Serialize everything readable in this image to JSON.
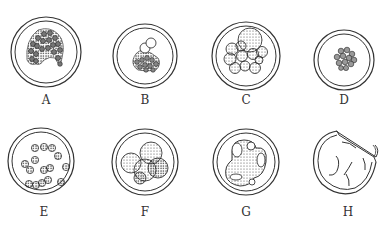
{
  "figure": {
    "panels": [
      {
        "label": "A",
        "cx": 46,
        "cy": 52,
        "r": 35,
        "content": "dense cluster of many small cells"
      },
      {
        "label": "B",
        "cx": 145,
        "cy": 56,
        "r": 32,
        "content": "compact cell mass with two larger cells on top"
      },
      {
        "label": "C",
        "cx": 246,
        "cy": 56,
        "r": 34,
        "content": "cluster of stippled cells with one large cell"
      },
      {
        "label": "D",
        "cx": 344,
        "cy": 60,
        "r": 30,
        "content": "small compact cluster of cells"
      },
      {
        "label": "E",
        "cx": 41,
        "cy": 161,
        "r": 33,
        "content": "scattered separate cells"
      },
      {
        "label": "F",
        "cx": 145,
        "cy": 162,
        "r": 33,
        "content": "few large stippled overlapping cells"
      },
      {
        "label": "G",
        "cx": 246,
        "cy": 162,
        "r": 33,
        "content": "large stippled mass with vacuoles"
      },
      {
        "label": "H",
        "cx": 344,
        "cy": 164,
        "r": 32,
        "content": "ruptured empty shell"
      }
    ],
    "colors": {
      "line": "#333333",
      "background": "#ffffff"
    }
  }
}
